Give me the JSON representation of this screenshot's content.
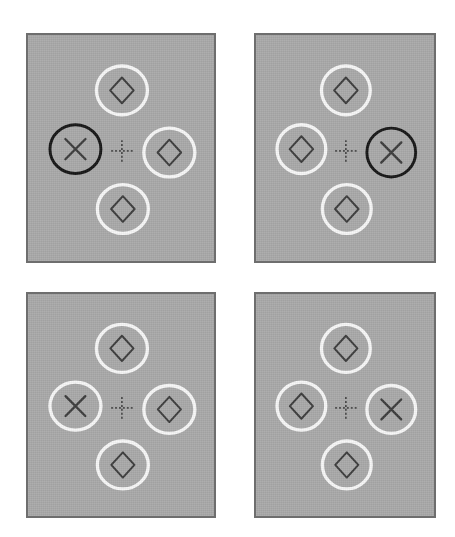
{
  "figure": {
    "background_color": "#ffffff",
    "panel_fill_color": "#a9a9a9",
    "panel_border_color": "#6e6e6e",
    "white_ring_color": "#f7f7f7",
    "black_ring_color": "#161616",
    "symbol_color": "#3c3c3c",
    "fixation_color": "#4a4a4a",
    "layout": "2x2 grid of stimulus display panels",
    "panel_count": 4
  },
  "fixation": {
    "name": "dashed-cross",
    "description": "small dashed plus sign at panel centre",
    "arm_length_px": 11,
    "dash_pattern": "2,2"
  },
  "panels": [
    {
      "id": "panel-top-left",
      "position": "top-left",
      "x": 26,
      "y": 33,
      "width": 190,
      "height": 230,
      "items": [
        {
          "slot": "top",
          "ring": "white",
          "symbol": "diamond"
        },
        {
          "slot": "left",
          "ring": "black",
          "symbol": "x"
        },
        {
          "slot": "right",
          "ring": "white",
          "symbol": "diamond"
        },
        {
          "slot": "bottom",
          "ring": "white",
          "symbol": "diamond"
        }
      ],
      "target_slot": "left",
      "singleton_ring": "black"
    },
    {
      "id": "panel-top-right",
      "position": "top-right",
      "x": 254,
      "y": 33,
      "width": 182,
      "height": 230,
      "items": [
        {
          "slot": "top",
          "ring": "white",
          "symbol": "diamond"
        },
        {
          "slot": "left",
          "ring": "white",
          "symbol": "diamond"
        },
        {
          "slot": "right",
          "ring": "black",
          "symbol": "x"
        },
        {
          "slot": "bottom",
          "ring": "white",
          "symbol": "diamond"
        }
      ],
      "target_slot": "right",
      "singleton_ring": "black"
    },
    {
      "id": "panel-bottom-left",
      "position": "bottom-left",
      "x": 26,
      "y": 292,
      "width": 190,
      "height": 226,
      "items": [
        {
          "slot": "top",
          "ring": "white",
          "symbol": "diamond"
        },
        {
          "slot": "left",
          "ring": "white",
          "symbol": "x"
        },
        {
          "slot": "right",
          "ring": "white",
          "symbol": "diamond"
        },
        {
          "slot": "bottom",
          "ring": "white",
          "symbol": "diamond"
        }
      ],
      "target_slot": "left",
      "singleton_ring": "none"
    },
    {
      "id": "panel-bottom-right",
      "position": "bottom-right",
      "x": 254,
      "y": 292,
      "width": 182,
      "height": 226,
      "items": [
        {
          "slot": "top",
          "ring": "white",
          "symbol": "diamond"
        },
        {
          "slot": "left",
          "ring": "white",
          "symbol": "diamond"
        },
        {
          "slot": "right",
          "ring": "white",
          "symbol": "x"
        },
        {
          "slot": "bottom",
          "ring": "white",
          "symbol": "diamond"
        }
      ],
      "target_slot": "right",
      "singleton_ring": "none"
    }
  ]
}
